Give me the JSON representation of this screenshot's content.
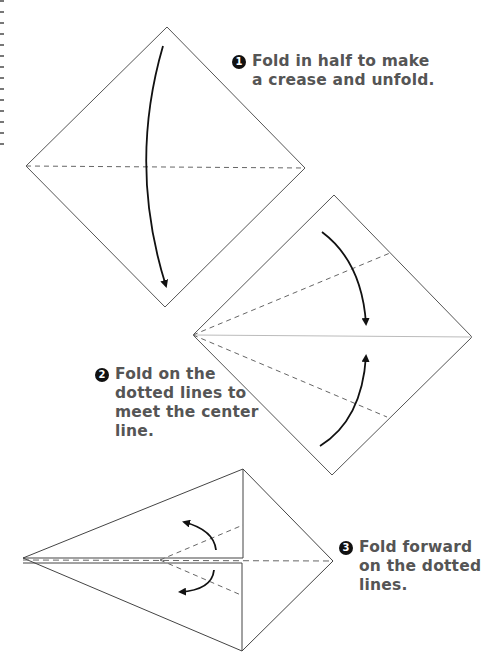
{
  "steps": [
    {
      "number": "1",
      "lines": [
        "Fold in half to make",
        "a crease and unfold."
      ]
    },
    {
      "number": "2",
      "lines": [
        "Fold on the",
        "dotted lines to",
        "meet the center",
        "line."
      ]
    },
    {
      "number": "3",
      "lines": [
        "Fold forward",
        "on the dotted",
        "lines."
      ]
    }
  ],
  "colors": {
    "text": "#555555",
    "line": "#444444",
    "badge": "#111111"
  },
  "icons": [
    "fold-down-arrow-icon",
    "fold-in-arrow-icon",
    "fold-out-arrow-icon"
  ]
}
